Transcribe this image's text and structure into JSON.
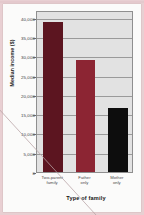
{
  "chart_data": {
    "type": "bar",
    "title": "",
    "subtitle": "",
    "xlabel": "Type of family",
    "ylabel": "Median income ($)",
    "categories": [
      "Two-parent family",
      "Father only",
      "Mother only"
    ],
    "category_lines": [
      [
        "Two-parent",
        "family"
      ],
      [
        "Father",
        "only"
      ],
      [
        "Mother",
        "only"
      ]
    ],
    "values": [
      39000,
      29000,
      16500
    ],
    "ylim": [
      0,
      42000
    ],
    "yticks": [
      0,
      5000,
      10000,
      15000,
      20000,
      25000,
      30000,
      35000,
      40000
    ],
    "ytick_labels": [
      "0",
      "5,000",
      "10,000",
      "15,000",
      "20,000",
      "25,000",
      "30,000",
      "35,000",
      "40,000"
    ],
    "grid": true,
    "legend": "none",
    "bar_colors": [
      "#5c1520",
      "#8c2533",
      "#0d0d0d"
    ],
    "plot_background": "#e2e2e2",
    "gridline_color": "#9a9a9a",
    "axis_color": "#8f8f8f"
  }
}
